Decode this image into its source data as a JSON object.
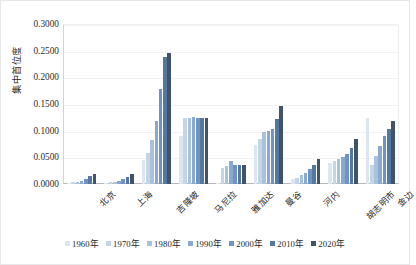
{
  "chart_data": {
    "type": "bar",
    "title": "",
    "xlabel": "",
    "ylabel": "集中首位度",
    "ylim": [
      0.0,
      0.3
    ],
    "ytick_labels": [
      "0.0000",
      "0.0500",
      "0.1000",
      "0.1500",
      "0.2000",
      "0.2500",
      "0.3000"
    ],
    "ytick_values": [
      0.0,
      0.05,
      0.1,
      0.15,
      0.2,
      0.25,
      0.3
    ],
    "grid": true,
    "legend_position": "bottom",
    "categories": [
      "北京",
      "上海",
      "吉隆坡",
      "马尼拉",
      "雅加达",
      "曼谷",
      "河内",
      "胡志明市",
      "金边"
    ],
    "series": [
      {
        "name": "1960年",
        "color": "#dce6f1",
        "values": [
          0.002,
          0.002,
          0.045,
          0.09,
          0.0,
          0.074,
          0.009,
          0.039,
          0.124
        ]
      },
      {
        "name": "1970年",
        "color": "#c5d5e8",
        "values": [
          0.003,
          0.003,
          0.058,
          0.124,
          0.03,
          0.084,
          0.012,
          0.043,
          0.035
        ]
      },
      {
        "name": "1980年",
        "color": "#a8c1dc",
        "values": [
          0.004,
          0.004,
          0.082,
          0.124,
          0.034,
          0.098,
          0.016,
          0.046,
          0.053
        ]
      },
      {
        "name": "1990年",
        "color": "#89a9cf",
        "values": [
          0.006,
          0.006,
          0.118,
          0.126,
          0.043,
          0.1,
          0.021,
          0.05,
          0.072
        ]
      },
      {
        "name": "2000年",
        "color": "#6f93c2",
        "values": [
          0.01,
          0.01,
          0.178,
          0.124,
          0.035,
          0.103,
          0.028,
          0.057,
          0.09
        ]
      },
      {
        "name": "2010年",
        "color": "#54789f",
        "values": [
          0.015,
          0.014,
          0.238,
          0.124,
          0.035,
          0.121,
          0.036,
          0.067,
          0.104
        ]
      },
      {
        "name": "2020年",
        "color": "#40536b",
        "values": [
          0.019,
          0.018,
          0.245,
          0.124,
          0.036,
          0.147,
          0.046,
          0.085,
          0.119
        ]
      }
    ]
  },
  "axis": {
    "y_label": "集中首位度"
  }
}
